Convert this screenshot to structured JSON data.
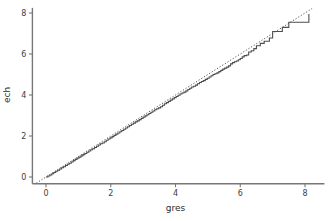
{
  "chart_data": {
    "type": "line",
    "title": "",
    "subtitle": "",
    "xlabel": "gres",
    "ylabel": "ech",
    "xlim": [
      -0.55,
      8.6
    ],
    "ylim": [
      -0.45,
      8.25
    ],
    "xticks": [
      0,
      2,
      4,
      6,
      8
    ],
    "yticks": [
      0,
      2,
      4,
      6,
      8
    ],
    "xtick_labels": [
      "0",
      "2",
      "4",
      "6",
      "8"
    ],
    "ytick_labels": [
      "0",
      "2",
      "4",
      "6",
      "8"
    ],
    "grid": false,
    "legend": "none",
    "background": "#ffffff",
    "series": [
      {
        "name": "empirical-step-curve",
        "style": "solid-step",
        "color": "#4d4d4d",
        "linewidth": 1.1,
        "points": [
          [
            0.0,
            0.0
          ],
          [
            0.06,
            0.05
          ],
          [
            0.12,
            0.1
          ],
          [
            0.18,
            0.16
          ],
          [
            0.24,
            0.22
          ],
          [
            0.3,
            0.28
          ],
          [
            0.36,
            0.33
          ],
          [
            0.42,
            0.39
          ],
          [
            0.48,
            0.45
          ],
          [
            0.54,
            0.5
          ],
          [
            0.6,
            0.56
          ],
          [
            0.66,
            0.62
          ],
          [
            0.72,
            0.67
          ],
          [
            0.78,
            0.73
          ],
          [
            0.84,
            0.8
          ],
          [
            0.9,
            0.86
          ],
          [
            0.96,
            0.92
          ],
          [
            1.02,
            0.97
          ],
          [
            1.08,
            1.03
          ],
          [
            1.14,
            1.09
          ],
          [
            1.2,
            1.15
          ],
          [
            1.26,
            1.21
          ],
          [
            1.32,
            1.27
          ],
          [
            1.38,
            1.33
          ],
          [
            1.44,
            1.38
          ],
          [
            1.5,
            1.44
          ],
          [
            1.56,
            1.5
          ],
          [
            1.62,
            1.56
          ],
          [
            1.68,
            1.62
          ],
          [
            1.74,
            1.66
          ],
          [
            1.8,
            1.72
          ],
          [
            1.86,
            1.79
          ],
          [
            1.92,
            1.85
          ],
          [
            1.98,
            1.91
          ],
          [
            2.04,
            1.97
          ],
          [
            2.1,
            2.03
          ],
          [
            2.16,
            2.09
          ],
          [
            2.22,
            2.15
          ],
          [
            2.28,
            2.21
          ],
          [
            2.34,
            2.27
          ],
          [
            2.4,
            2.33
          ],
          [
            2.46,
            2.39
          ],
          [
            2.52,
            2.45
          ],
          [
            2.58,
            2.51
          ],
          [
            2.64,
            2.57
          ],
          [
            2.7,
            2.63
          ],
          [
            2.76,
            2.69
          ],
          [
            2.82,
            2.74
          ],
          [
            2.88,
            2.8
          ],
          [
            2.94,
            2.86
          ],
          [
            3.0,
            2.92
          ],
          [
            3.06,
            2.98
          ],
          [
            3.12,
            3.04
          ],
          [
            3.18,
            3.1
          ],
          [
            3.24,
            3.16
          ],
          [
            3.3,
            3.22
          ],
          [
            3.36,
            3.28
          ],
          [
            3.42,
            3.33
          ],
          [
            3.48,
            3.37
          ],
          [
            3.54,
            3.43
          ],
          [
            3.6,
            3.5
          ],
          [
            3.66,
            3.57
          ],
          [
            3.72,
            3.63
          ],
          [
            3.78,
            3.69
          ],
          [
            3.84,
            3.75
          ],
          [
            3.9,
            3.81
          ],
          [
            3.96,
            3.87
          ],
          [
            4.02,
            3.93
          ],
          [
            4.08,
            3.99
          ],
          [
            4.14,
            4.05
          ],
          [
            4.2,
            4.1
          ],
          [
            4.26,
            4.14
          ],
          [
            4.32,
            4.2
          ],
          [
            4.38,
            4.27
          ],
          [
            4.44,
            4.33
          ],
          [
            4.5,
            4.39
          ],
          [
            4.56,
            4.43
          ],
          [
            4.62,
            4.48
          ],
          [
            4.68,
            4.55
          ],
          [
            4.74,
            4.61
          ],
          [
            4.8,
            4.66
          ],
          [
            4.86,
            4.7
          ],
          [
            4.92,
            4.76
          ],
          [
            4.98,
            4.82
          ],
          [
            5.04,
            4.88
          ],
          [
            5.1,
            4.94
          ],
          [
            5.16,
            5.0
          ],
          [
            5.22,
            5.04
          ],
          [
            5.28,
            5.08
          ],
          [
            5.34,
            5.14
          ],
          [
            5.4,
            5.2
          ],
          [
            5.46,
            5.26
          ],
          [
            5.52,
            5.31
          ],
          [
            5.58,
            5.36
          ],
          [
            5.64,
            5.42
          ],
          [
            5.7,
            5.52
          ],
          [
            5.76,
            5.58
          ],
          [
            5.82,
            5.62
          ],
          [
            5.88,
            5.66
          ],
          [
            5.94,
            5.72
          ],
          [
            6.0,
            5.78
          ],
          [
            6.06,
            5.86
          ],
          [
            6.12,
            5.92
          ],
          [
            6.2,
            5.95
          ],
          [
            6.26,
            6.1
          ],
          [
            6.34,
            6.16
          ],
          [
            6.42,
            6.26
          ],
          [
            6.5,
            6.4
          ],
          [
            6.62,
            6.52
          ],
          [
            6.74,
            6.62
          ],
          [
            6.9,
            6.78
          ],
          [
            7.0,
            7.1
          ],
          [
            7.3,
            7.3
          ],
          [
            7.5,
            7.55
          ],
          [
            8.0,
            7.55
          ],
          [
            8.12,
            7.55
          ],
          [
            8.12,
            7.95
          ]
        ],
        "steps": [
          {
            "x": 5.62,
            "y_from": 5.4,
            "y_to": 5.52
          },
          {
            "x": 6.14,
            "y_from": 5.92,
            "y_to": 5.95
          },
          {
            "x": 6.22,
            "y_from": 5.95,
            "y_to": 6.1
          },
          {
            "x": 6.46,
            "y_from": 6.26,
            "y_to": 6.4
          },
          {
            "x": 6.86,
            "y_from": 6.62,
            "y_to": 6.78
          },
          {
            "x": 6.98,
            "y_from": 6.78,
            "y_to": 7.1
          },
          {
            "x": 7.44,
            "y_from": 7.3,
            "y_to": 7.55
          },
          {
            "x": 8.12,
            "y_from": 7.55,
            "y_to": 7.95
          }
        ]
      },
      {
        "name": "reference-line",
        "style": "dotted",
        "color": "#555555",
        "linewidth": 1.0,
        "description": "identity reference line y = x",
        "points": [
          [
            -0.3,
            -0.3
          ],
          [
            8.22,
            8.22
          ]
        ]
      }
    ]
  },
  "axes": {
    "x_axis_name": "x-axis",
    "y_axis_name": "y-axis",
    "tick_direction": "out",
    "spines": [
      "left",
      "bottom"
    ]
  }
}
